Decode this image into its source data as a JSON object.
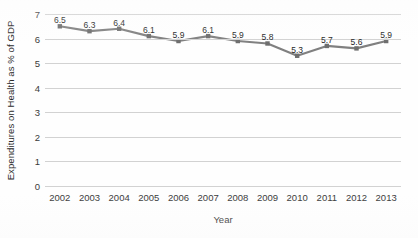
{
  "chart_data": {
    "type": "line",
    "title": "",
    "xlabel": "Year",
    "ylabel": "Expenditures on Health as % of GDP",
    "categories": [
      "2002",
      "2003",
      "2004",
      "2005",
      "2006",
      "2007",
      "2008",
      "2009",
      "2010",
      "2011",
      "2012",
      "2013"
    ],
    "values": [
      6.5,
      6.3,
      6.4,
      6.1,
      5.9,
      6.1,
      5.9,
      5.8,
      5.3,
      5.7,
      5.6,
      5.9
    ],
    "data_labels": [
      "6.5",
      "6.3",
      "6.4",
      "6.1",
      "5.9",
      "6.1",
      "5.9",
      "5.8",
      "5.3",
      "5.7",
      "5.6",
      "5.9"
    ],
    "ylim": [
      0,
      7
    ],
    "ytick_labels": [
      "0",
      "1",
      "2",
      "3",
      "4",
      "5",
      "6",
      "7"
    ],
    "ytick_values": [
      0,
      1,
      2,
      3,
      4,
      5,
      6,
      7
    ],
    "grid": "horizontal",
    "legend": "none",
    "series_color": "#808080",
    "marker": "square",
    "marker_color": "#6e6e6e",
    "gridline_color": "#d2d2d2"
  },
  "axes": {
    "y_title": "Expenditures on Health as % of GDP",
    "x_title": "Year"
  }
}
